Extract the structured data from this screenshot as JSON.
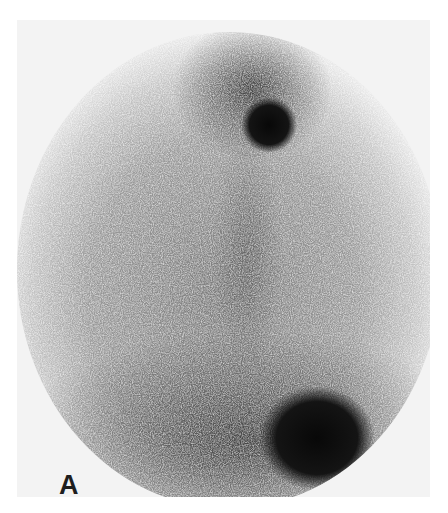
{
  "figure": {
    "panel_label": "A",
    "colors": {
      "background": "#ffffff",
      "field_background": "#f3f3f3",
      "activity_dark": "#111111",
      "activity_mid": "#6a6a6a"
    },
    "hotspots": [
      {
        "name": "upper-focal-uptake",
        "cx": 269,
        "cy": 125,
        "r": 22
      },
      {
        "name": "lower-right-uptake",
        "cx": 315,
        "cy": 435,
        "r": 45
      }
    ]
  }
}
